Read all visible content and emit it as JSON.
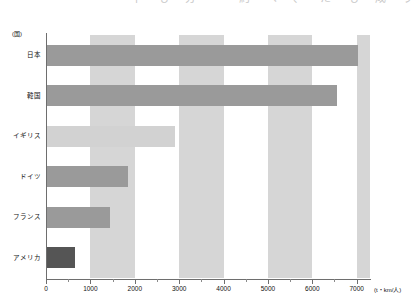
{
  "page": {
    "top_strip_text": "一 十 も 分 一 約 べ 、 た も 成 り 1 2 の 計"
  },
  "chart_data": {
    "type": "bar",
    "orientation": "horizontal",
    "title": "",
    "xlabel": "(t・km/人)",
    "ylabel": "(国)",
    "categories": [
      "日本",
      "韓国",
      "イギリス",
      "ドイツ",
      "フランス",
      "アメリカ"
    ],
    "values": [
      7030,
      6560,
      2910,
      1840,
      1450,
      650
    ],
    "bar_colors": [
      "#9a9a9a",
      "#9a9a9a",
      "#d2d2d2",
      "#9a9a9a",
      "#9a9a9a",
      "#555555"
    ],
    "xlim": [
      0,
      7300
    ],
    "xticks": [
      0,
      1000,
      2000,
      3000,
      4000,
      5000,
      6000,
      7000
    ],
    "xtick_labels": [
      "0",
      "1000",
      "2000",
      "3000",
      "4000",
      "5000",
      "6000",
      "7000"
    ],
    "minor_tick_step": 500,
    "grid": false,
    "band_color": "#d6d6d6",
    "bands": [
      [
        1000,
        2000
      ],
      [
        3000,
        4000
      ],
      [
        5000,
        6000
      ],
      [
        7000,
        7300
      ]
    ],
    "legend": []
  },
  "axis": {
    "y_unit": "(国)",
    "x_unit": "(t・km/人)"
  }
}
